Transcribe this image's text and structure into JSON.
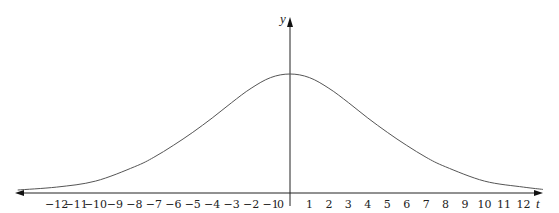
{
  "chart_data": {
    "type": "line",
    "title": "",
    "xlabel": "t",
    "ylabel": "y",
    "xlim": [
      -14.4,
      12.8
    ],
    "ylim": [
      0,
      1.15
    ],
    "grid": false,
    "legend": null,
    "x_ticks": [
      -12,
      -11,
      -10,
      -9,
      -8,
      -7,
      -6,
      -5,
      -4,
      -3,
      -2,
      -1,
      0,
      1,
      2,
      3,
      4,
      5,
      6,
      7,
      8,
      9,
      10,
      11,
      12
    ],
    "x_tick_labels": [
      "−12",
      "−11",
      "−10",
      "−9",
      "−8",
      "−7",
      "−6",
      "−5",
      "−4",
      "−3",
      "−2",
      "−1",
      "0",
      "1",
      "2",
      "3",
      "4",
      "5",
      "6",
      "7",
      "8",
      "9",
      "10",
      "11",
      "12"
    ],
    "series": [
      {
        "name": "bell curve",
        "description": "symmetric bell-shaped curve peaking at t=0, approaching the t-axis asymptotically",
        "x": [
          -14,
          -12,
          -10,
          -8,
          -7,
          -6,
          -5,
          -4,
          -3,
          -2,
          -1,
          0,
          1,
          2,
          3,
          4,
          5,
          6,
          7,
          8,
          10,
          12,
          13
        ],
        "values": [
          0.025,
          0.05,
          0.1,
          0.22,
          0.3,
          0.4,
          0.51,
          0.63,
          0.76,
          0.88,
          0.97,
          1.0,
          0.97,
          0.88,
          0.76,
          0.63,
          0.51,
          0.4,
          0.3,
          0.22,
          0.1,
          0.05,
          0.03
        ]
      }
    ]
  },
  "layout": {
    "origin_x": 290,
    "origin_y": 193,
    "unit_px": 19.45,
    "peak_px": 119,
    "x_axis_left": 15,
    "x_axis_right": 543,
    "y_axis_top": 17,
    "colors": {
      "axis": "#222222",
      "curve": "#555555"
    }
  }
}
